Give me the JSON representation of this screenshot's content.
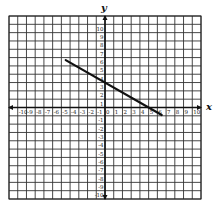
{
  "chart_data": {
    "type": "line",
    "title": "",
    "xlabel": "x",
    "ylabel": "y",
    "xlim": [
      -11,
      11
    ],
    "ylim": [
      -11,
      11
    ],
    "grid": true,
    "x_ticks": [
      -10,
      -9,
      -8,
      -7,
      -6,
      -5,
      -4,
      -3,
      -2,
      -1,
      0,
      1,
      2,
      3,
      4,
      5,
      6,
      7,
      8,
      9,
      10
    ],
    "y_ticks": [
      -10,
      -9,
      -8,
      -7,
      -6,
      -5,
      -4,
      -3,
      -2,
      -1,
      1,
      2,
      3,
      4,
      5,
      6,
      7,
      8,
      9,
      10
    ],
    "series": [
      {
        "name": "line segment",
        "equation": "y = -0.6x + 3",
        "x": [
          -4.5,
          6.5
        ],
        "y": [
          5.7,
          -0.9
        ]
      }
    ],
    "colors": {
      "grid": "#333333",
      "line": "#111111",
      "background": "#ffffff"
    }
  }
}
